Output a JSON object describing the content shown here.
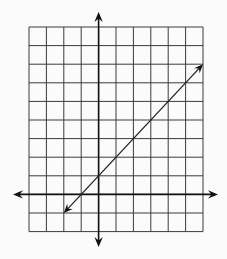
{
  "header": {
    "cropped_text_fragment": ""
  },
  "colors": {
    "background": "#fbfbfb",
    "grid": "#3a3a3a",
    "axis": "#111111",
    "line": "#222222"
  },
  "chart_data": {
    "type": "line",
    "title": "",
    "xlabel": "",
    "ylabel": "",
    "grid": true,
    "xlim": [
      -4,
      6
    ],
    "ylim": [
      -2,
      9
    ],
    "axes_arrows": true,
    "tick_labels": false,
    "series": [
      {
        "name": "line",
        "equation": "y = x + 1",
        "slope": 1,
        "y_intercept": 1,
        "x": [
          -2,
          6
        ],
        "y": [
          -1,
          7
        ],
        "arrows_both_ends": true
      }
    ]
  },
  "layout": {
    "grid_left_px": 29,
    "grid_top_px": 27,
    "col_width_px": 17.4,
    "row_height_px": 18.6,
    "x_axis_extent_px": [
      13,
      218
    ],
    "y_axis_extent_px": [
      12,
      247
    ]
  }
}
